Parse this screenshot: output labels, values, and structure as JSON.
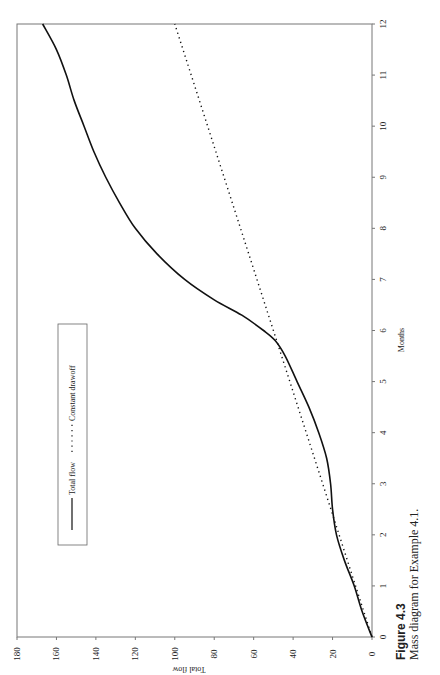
{
  "figure": {
    "label": "Figure 4.3",
    "caption": "Mass diagram for Example 4.1."
  },
  "chart_data": {
    "type": "line",
    "orientation": "rotated 90° counter-clockwise on page",
    "title": "",
    "xlabel": "Months",
    "ylabel": "Total flow",
    "xlim": [
      0,
      12
    ],
    "ylim": [
      0,
      180
    ],
    "x_ticks": [
      "0",
      "1",
      "2",
      "3",
      "4",
      "5",
      "6",
      "7",
      "8",
      "9",
      "10",
      "11",
      "12"
    ],
    "y_ticks": [
      "0",
      "20",
      "40",
      "60",
      "80",
      "100",
      "120",
      "140",
      "160",
      "180"
    ],
    "grid": false,
    "legend": {
      "position": "inside upper-left (of unrotated plot)",
      "entries": [
        {
          "label": "Total flow",
          "style": "solid"
        },
        {
          "label": "Constant drawoff",
          "style": "dotted"
        }
      ]
    },
    "series": [
      {
        "name": "Total flow",
        "style": "solid",
        "color": "#111111",
        "x": [
          0,
          0.5,
          1,
          1.5,
          2,
          2.5,
          3,
          3.5,
          4,
          4.5,
          5,
          5.5,
          5.8,
          6,
          6.3,
          6.6,
          7,
          7.5,
          8,
          8.5,
          9,
          9.5,
          10,
          10.5,
          11,
          11.5,
          12
        ],
        "y": [
          0,
          5,
          9,
          14,
          18,
          20,
          21,
          23,
          27,
          32,
          38,
          44,
          49,
          55,
          66,
          80,
          95,
          109,
          120,
          128,
          135,
          141,
          146,
          151,
          155,
          160,
          167
        ]
      },
      {
        "name": "Constant drawoff",
        "style": "dotted",
        "color": "#111111",
        "x": [
          0,
          12
        ],
        "y": [
          0,
          100
        ]
      }
    ]
  }
}
